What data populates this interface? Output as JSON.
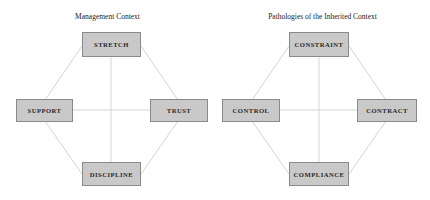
{
  "diagrams": [
    {
      "title": "Management Context",
      "nodes": {
        "top": "STRETCH",
        "left": "SUPPORT",
        "right": "TRUST",
        "bottom": "DISCIPLINE"
      }
    },
    {
      "title": "Pathologies of the Inherited Context",
      "nodes": {
        "top": "CONSTRAINT",
        "left": "CONTROL",
        "right": "CONTRACT",
        "bottom": "COMPLIANCE"
      }
    }
  ],
  "colors": {
    "node_fill": "#c9c9c9",
    "node_border": "#8a8a8a",
    "connector": "#d4d4d4"
  }
}
